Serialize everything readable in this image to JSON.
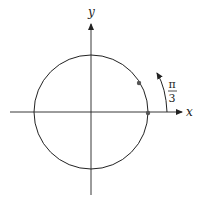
{
  "diagram": {
    "title": "",
    "axes": {
      "x_label": "x",
      "y_label": "y"
    },
    "circle": {
      "type": "unit-circle"
    },
    "points": [
      {
        "name": "point-angle-0"
      },
      {
        "name": "point-angle-pi-over-3"
      }
    ],
    "angle": {
      "numerator": "π",
      "denominator": "3",
      "direction": "counterclockwise"
    },
    "colors": {
      "stroke": "#222222",
      "point": "#444444",
      "background": "#ffffff"
    }
  }
}
